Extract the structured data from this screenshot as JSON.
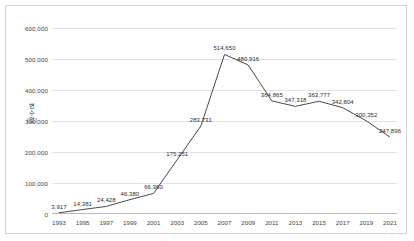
{
  "chart_data": {
    "type": "line",
    "title": "",
    "xlabel": "",
    "ylabel": "변수(명)",
    "categories": [
      1993,
      1995,
      1997,
      1999,
      2001,
      2003,
      2005,
      2007,
      2009,
      2011,
      2013,
      2015,
      2017,
      2019,
      2021
    ],
    "values": [
      3917,
      14381,
      24428,
      46380,
      66360,
      175251,
      283731,
      514650,
      480916,
      364865,
      347318,
      363777,
      342804,
      300352,
      247896
    ],
    "data_labels": [
      "3,917",
      "14,381",
      "24,428",
      "46,380",
      "66,360",
      "175,251",
      "283,731",
      "514,650",
      "480,916",
      "364,865",
      "347,318",
      "363,777",
      "342,804",
      "300,352",
      "247,896"
    ],
    "xtick_labels": [
      "1993",
      "1995",
      "1997",
      "1999",
      "2001",
      "2003",
      "2005",
      "2007",
      "2009",
      "2011",
      "2013",
      "2015",
      "2017",
      "2019",
      "2021"
    ],
    "ytick_labels": [
      "0",
      "100,000",
      "200,000",
      "300,000",
      "400,000",
      "500,000",
      "600,000"
    ],
    "ytick_values": [
      0,
      100000,
      200000,
      300000,
      400000,
      500000,
      600000
    ],
    "ylim": [
      0,
      600000
    ],
    "grid": true,
    "legend": false,
    "series_color": "#4a4a4a",
    "grid_color": "#e3e3e3",
    "border_color": "#d2d2d2"
  }
}
